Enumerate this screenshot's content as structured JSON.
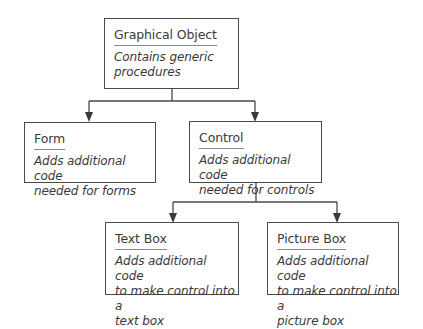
{
  "diagram": {
    "type": "class hierarchy",
    "nodes": [
      {
        "id": "graphical_object",
        "title": "Graphical Object",
        "description": "Contains generic\nprocedures"
      },
      {
        "id": "form",
        "title": "Form",
        "description": "Adds additional code\nneeded for forms"
      },
      {
        "id": "control",
        "title": "Control",
        "description": "Adds additional code\nneeded for controls"
      },
      {
        "id": "text_box",
        "title": "Text Box",
        "description": "Adds additional code\nto make control into a\ntext box"
      },
      {
        "id": "picture_box",
        "title": "Picture Box",
        "description": "Adds additional code\nto make control into a\npicture box"
      }
    ],
    "edges": [
      {
        "from": "graphical_object",
        "to": "form"
      },
      {
        "from": "graphical_object",
        "to": "control"
      },
      {
        "from": "control",
        "to": "text_box"
      },
      {
        "from": "control",
        "to": "picture_box"
      }
    ],
    "line_color": "#4a4a4a"
  }
}
